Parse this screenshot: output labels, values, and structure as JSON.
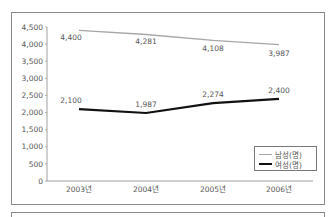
{
  "chart_data": {
    "type": "line",
    "title": "",
    "xlabel": "",
    "ylabel": "",
    "categories": [
      "2003년",
      "2004년",
      "2005년",
      "2006년"
    ],
    "series": [
      {
        "name": "남성(명)",
        "values": [
          4400,
          4281,
          4108,
          3987
        ],
        "color": "#a6a6a6",
        "labels": [
          "4,400",
          "4,281",
          "4,108",
          "3,987"
        ]
      },
      {
        "name": "여성(명)",
        "values": [
          2100,
          1987,
          2274,
          2400
        ],
        "color": "#111111",
        "labels": [
          "2,100",
          "1,987",
          "2,274",
          "2,400"
        ]
      }
    ],
    "ylim": [
      0,
      4500
    ],
    "yticks": [
      0,
      500,
      1000,
      1500,
      2000,
      2500,
      3000,
      3500,
      4000,
      4500
    ],
    "ytick_labels": [
      "0",
      "500",
      "1,000",
      "1,500",
      "2,000",
      "2,500",
      "3,000",
      "3,500",
      "4,000",
      "4,500"
    ],
    "grid": false,
    "legend_position": "lower-right"
  },
  "legend": {
    "male": "남성(명)",
    "female": "여성(명)"
  }
}
